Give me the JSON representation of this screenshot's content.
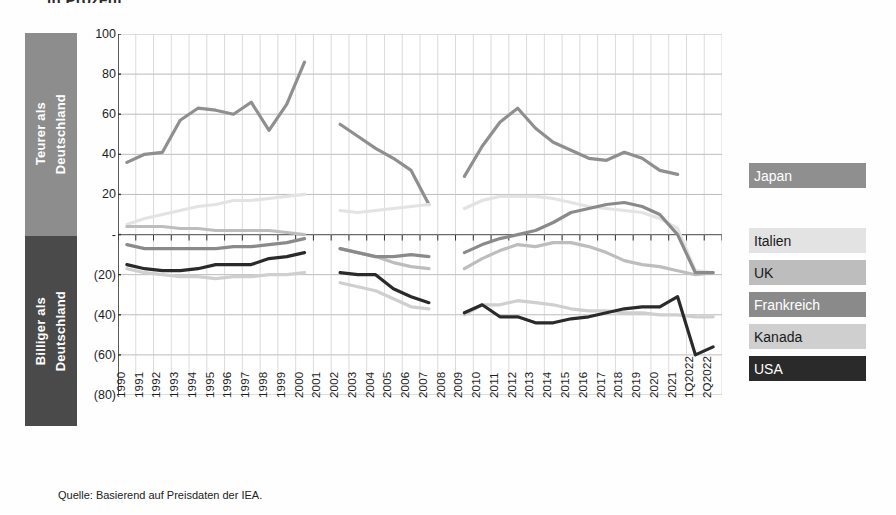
{
  "title_clipped": "in Prozent",
  "banners": {
    "upper": "Teurer als\nDeutschland",
    "lower": "Billiger als\nDeutschland",
    "upper_color": "#8d8d8d",
    "lower_color": "#4a4a4a"
  },
  "source": "Quelle: Basierend auf Preisdaten der IEA.",
  "legend": [
    {
      "label": "Japan",
      "color": "#8f8f8f",
      "text_color": "#ffffff",
      "top": 0
    },
    {
      "label": "Italien",
      "color": "#e3e3e3",
      "text_color": "#1a1a1a",
      "top": 65
    },
    {
      "label": "UK",
      "color": "#bdbdbd",
      "text_color": "#1a1a1a",
      "top": 97
    },
    {
      "label": "Frankreich",
      "color": "#8a8a8a",
      "text_color": "#ffffff",
      "top": 129
    },
    {
      "label": "Kanada",
      "color": "#cfcfcf",
      "text_color": "#1a1a1a",
      "top": 161
    },
    {
      "label": "USA",
      "color": "#2a2a2a",
      "text_color": "#ffffff",
      "top": 193
    }
  ],
  "chart_data": {
    "type": "line",
    "title": "in Prozent",
    "xlabel": "",
    "ylabel": "",
    "ylim": [
      -80,
      100
    ],
    "yticks": [
      100,
      80,
      60,
      40,
      20,
      0,
      -20,
      -40,
      -60,
      -80
    ],
    "ytick_labels": [
      "100",
      "80",
      "60",
      "40",
      "20",
      "-",
      "(20)",
      "(40)",
      "(60)",
      "(80)"
    ],
    "grid": true,
    "legend_position": "right",
    "categories": [
      "1990",
      "1991",
      "1992",
      "1993",
      "1994",
      "1995",
      "1996",
      "1997",
      "1998",
      "1999",
      "2000",
      "2001",
      "2002",
      "2003",
      "2004",
      "2005",
      "2006",
      "2007",
      "2008",
      "2009",
      "2010",
      "2011",
      "2012",
      "2013",
      "2014",
      "2015",
      "2016",
      "2017",
      "2018",
      "2019",
      "2020",
      "2021",
      "1Q2022",
      "2Q2022"
    ],
    "series": [
      {
        "name": "Japan",
        "color": "#8f8f8f",
        "values": [
          36,
          40,
          41,
          57,
          63,
          62,
          60,
          66,
          52,
          65,
          86,
          null,
          55,
          49,
          43,
          38,
          32,
          15,
          null,
          29,
          44,
          56,
          63,
          53,
          46,
          42,
          38,
          37,
          41,
          38,
          32,
          30,
          null,
          null
        ]
      },
      {
        "name": "Italien",
        "color": "#e3e3e3",
        "values": [
          5,
          8,
          10,
          12,
          14,
          15,
          17,
          17,
          18,
          19,
          20,
          null,
          12,
          11,
          12,
          13,
          14,
          15,
          null,
          13,
          17,
          19,
          19,
          19,
          18,
          16,
          14,
          13,
          12,
          11,
          8,
          3,
          -18,
          -19
        ]
      },
      {
        "name": "UK",
        "color": "#bdbdbd",
        "values": [
          4,
          4,
          4,
          3,
          3,
          2,
          2,
          2,
          2,
          1,
          0,
          null,
          -7,
          -9,
          -11,
          -14,
          -16,
          -17,
          null,
          -17,
          -12,
          -8,
          -5,
          -6,
          -4,
          -4,
          -6,
          -9,
          -13,
          -15,
          -16,
          -18,
          -20,
          -19
        ]
      },
      {
        "name": "Frankreich",
        "color": "#8a8a8a",
        "values": [
          -5,
          -7,
          -7,
          -7,
          -7,
          -7,
          -6,
          -6,
          -5,
          -4,
          -2,
          null,
          -7,
          -9,
          -11,
          -11,
          -10,
          -11,
          null,
          -9,
          -5,
          -2,
          0,
          2,
          6,
          11,
          13,
          15,
          16,
          14,
          10,
          0,
          -19,
          -19
        ]
      },
      {
        "name": "Kanada",
        "color": "#cfcfcf",
        "values": [
          -17,
          -19,
          -20,
          -21,
          -21,
          -22,
          -21,
          -21,
          -20,
          -20,
          -19,
          null,
          -24,
          -26,
          -28,
          -32,
          -36,
          -37,
          null,
          -40,
          -35,
          -35,
          -33,
          -34,
          -35,
          -37,
          -38,
          -38,
          -39,
          -39,
          -40,
          -40,
          -41,
          -41
        ]
      },
      {
        "name": "USA",
        "color": "#2a2a2a",
        "values": [
          -15,
          -17,
          -18,
          -18,
          -17,
          -15,
          -15,
          -15,
          -12,
          -11,
          -9,
          null,
          -19,
          -20,
          -20,
          -27,
          -31,
          -34,
          null,
          -39,
          -35,
          -41,
          -41,
          -44,
          -44,
          -42,
          -41,
          -39,
          -37,
          -36,
          -36,
          -31,
          -60,
          -56
        ]
      }
    ]
  }
}
